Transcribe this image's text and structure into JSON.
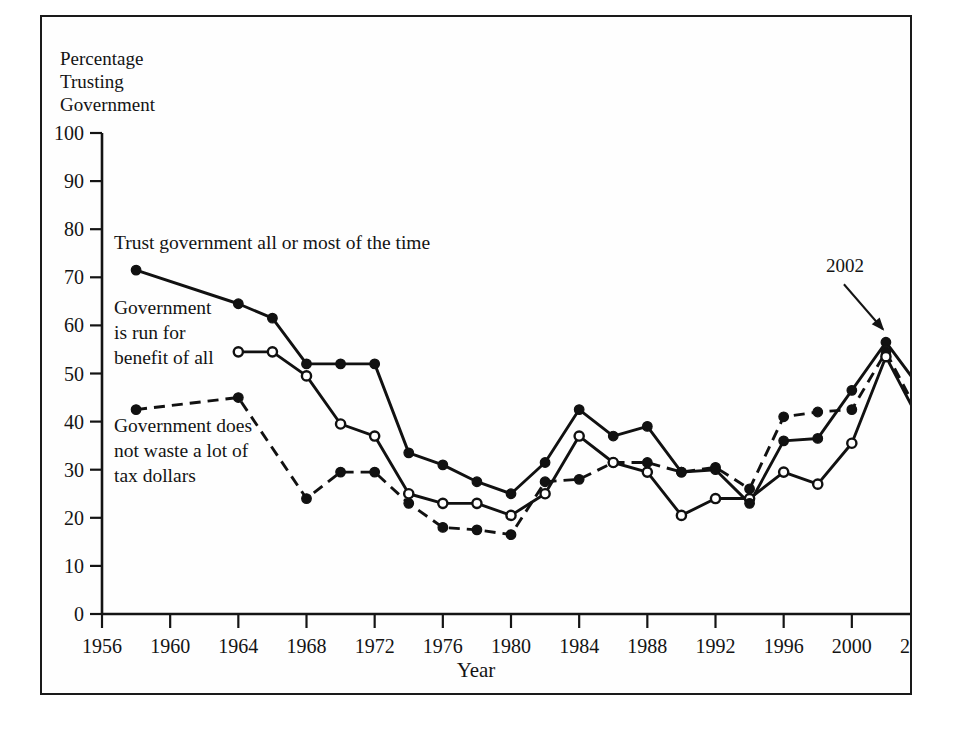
{
  "figure": {
    "y_axis_title_lines": [
      "Percentage",
      "Trusting",
      "Government"
    ],
    "x_axis_title": "Year"
  },
  "annotations": {
    "series_trust": "Trust government all or most of the time",
    "series_benefit_lines": [
      "Government",
      "is run for",
      "benefit of all"
    ],
    "series_waste_lines": [
      "Government does",
      "not waste a lot of",
      "tax dollars"
    ],
    "peak_callout": "2002"
  },
  "chart_data": {
    "type": "line",
    "title": "",
    "xlabel": "Year",
    "ylabel": "Percentage Trusting Government",
    "xlim": [
      1956,
      2004
    ],
    "ylim": [
      0,
      100
    ],
    "grid": false,
    "legend_position": "inline-annotations",
    "x_ticks": [
      1956,
      1960,
      1964,
      1968,
      1972,
      1976,
      1980,
      1984,
      1988,
      1992,
      1996,
      2000,
      2004
    ],
    "y_ticks": [
      0,
      10,
      20,
      30,
      40,
      50,
      60,
      70,
      80,
      90,
      100
    ],
    "series": [
      {
        "name": "Trust government all or most of the time",
        "style": "solid",
        "marker": "filled-circle",
        "x": [
          1958,
          1964,
          1966,
          1968,
          1970,
          1972,
          1974,
          1976,
          1978,
          1980,
          1982,
          1984,
          1986,
          1988,
          1990,
          1992,
          1994,
          1996,
          1998,
          2000,
          2002,
          2004
        ],
        "values": [
          71.5,
          64.5,
          61.5,
          52.0,
          52.0,
          52.0,
          33.5,
          31.0,
          27.5,
          25.0,
          31.5,
          42.5,
          37.0,
          39.0,
          29.5,
          30.0,
          23.0,
          36.0,
          36.5,
          46.5,
          56.5,
          47.0
        ]
      },
      {
        "name": "Government is run for benefit of all",
        "style": "solid",
        "marker": "open-circle",
        "x": [
          1964,
          1966,
          1968,
          1970,
          1972,
          1974,
          1976,
          1978,
          1980,
          1982,
          1984,
          1986,
          1988,
          1990,
          1992,
          1994,
          1996,
          1998,
          2000,
          2002,
          2004
        ],
        "values": [
          54.5,
          54.5,
          49.5,
          39.5,
          37.0,
          25.0,
          23.0,
          23.0,
          20.5,
          25.0,
          37.0,
          31.5,
          29.5,
          20.5,
          24.0,
          24.0,
          29.5,
          27.0,
          35.5,
          53.5,
          40.0
        ]
      },
      {
        "name": "Government does not waste a lot of tax dollars",
        "style": "dashed",
        "marker": "filled-circle",
        "x": [
          1958,
          1964,
          1968,
          1970,
          1972,
          1974,
          1976,
          1978,
          1980,
          1982,
          1984,
          1986,
          1988,
          1990,
          1992,
          1994,
          1996,
          1998,
          2000,
          2002,
          2004
        ],
        "values": [
          42.5,
          45.0,
          24.0,
          29.5,
          29.5,
          23.0,
          18.0,
          17.5,
          16.5,
          27.5,
          28.0,
          31.5,
          31.5,
          29.5,
          30.5,
          26.0,
          41.0,
          42.0,
          42.5,
          54.5,
          41.0
        ]
      }
    ],
    "callouts": [
      {
        "label": "2002",
        "series": "Trust government all or most of the time",
        "x": 2002,
        "y": 56.5
      }
    ]
  }
}
